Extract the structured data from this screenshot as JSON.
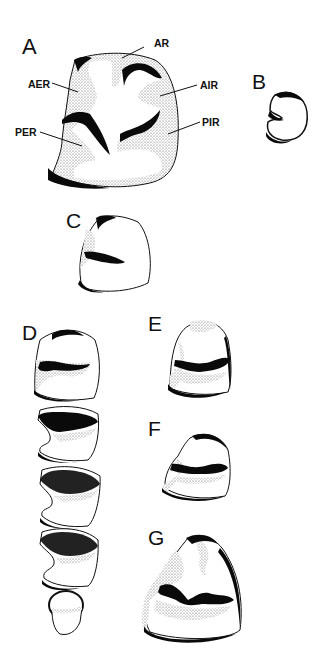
{
  "figure": {
    "panels": [
      {
        "id": "A",
        "label": "A",
        "annotations": [
          "AR",
          "AER",
          "AIR",
          "PER",
          "PIR"
        ]
      },
      {
        "id": "B",
        "label": "B"
      },
      {
        "id": "C",
        "label": "C"
      },
      {
        "id": "D",
        "label": "D"
      },
      {
        "id": "E",
        "label": "E"
      },
      {
        "id": "F",
        "label": "F"
      },
      {
        "id": "G",
        "label": "G"
      }
    ],
    "annotations": {
      "AR": "AR",
      "AER": "AER",
      "AIR": "AIR",
      "PER": "PER",
      "PIR": "PIR"
    },
    "colors": {
      "enamel": "#0a0a0a",
      "stipple": "#d8d8d8",
      "background": "#ffffff"
    }
  }
}
